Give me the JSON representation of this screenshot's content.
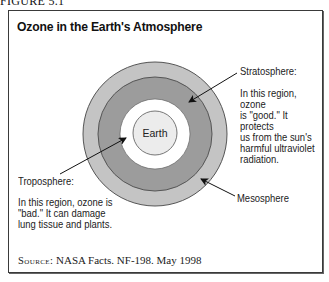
{
  "figure_label": "FIGURE 5.1",
  "title": "Ozone in the Earth's Atmosphere",
  "earth_label": "Earth",
  "layers": [
    {
      "key": "mesosphere",
      "name": "Mesosphere",
      "description": ""
    },
    {
      "key": "stratosphere",
      "name": "Stratosphere:",
      "description": "In this region, ozone\nis \"good.\" It protects\nus from the sun's\nharmful ultraviolet\nradiation."
    },
    {
      "key": "troposphere",
      "name": "Troposphere:",
      "description": "In this region, ozone is\n\"bad.\" It can damage\nlung tissue and plants."
    }
  ],
  "colors": {
    "mesosphere": "#c4c4c4",
    "stratosphere": "#9c9c9c",
    "troposphere": "#ffffff",
    "earth": "#ececec",
    "outline": "#555555"
  },
  "source": {
    "prefix": "Source:",
    "text": " NASA Facts. NF-198. May 1998"
  }
}
